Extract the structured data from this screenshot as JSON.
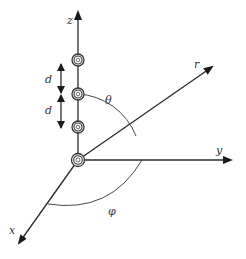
{
  "diagram": {
    "title": "",
    "axes": {
      "z": {
        "label": "z"
      },
      "y": {
        "label": "y"
      },
      "x": {
        "label": "x"
      },
      "r": {
        "label": "r"
      }
    },
    "angles": {
      "theta": {
        "label": "θ"
      },
      "phi": {
        "label": "φ"
      }
    },
    "spacing": [
      {
        "label": "d"
      },
      {
        "label": "d"
      }
    ],
    "dipoles": [
      {
        "position": "top"
      },
      {
        "position": "upper-middle"
      },
      {
        "position": "lower-middle"
      },
      {
        "position": "origin"
      }
    ],
    "colors": {
      "line": "#2a2a2a",
      "background": "#ffffff"
    }
  }
}
